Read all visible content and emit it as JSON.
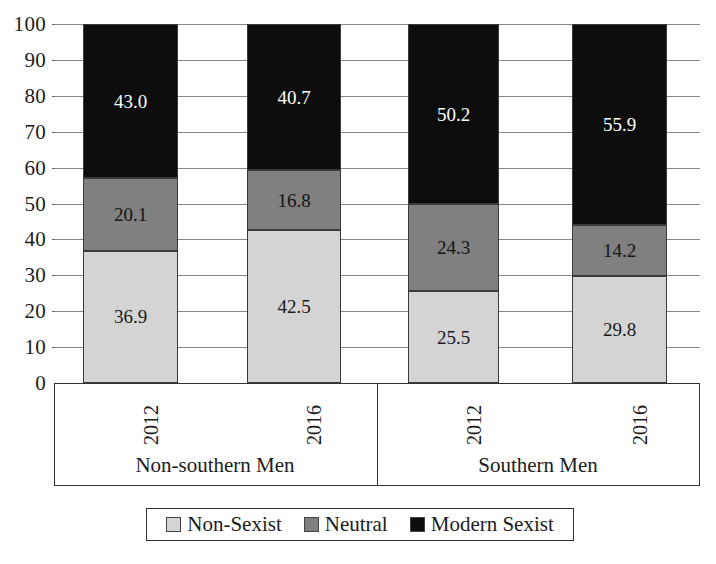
{
  "chart_data": {
    "type": "bar",
    "subtype": "stacked-bar-100",
    "title": "",
    "xlabel": "",
    "ylabel": "",
    "ylim": [
      0,
      100
    ],
    "ytick_step": 10,
    "grid": true,
    "legend_position": "bottom",
    "stacked": true,
    "categories": [
      "2012",
      "2016",
      "2012",
      "2016"
    ],
    "groups": [
      {
        "label": "Non-southern Men",
        "categories": [
          "2012",
          "2016"
        ]
      },
      {
        "label": "Southern Men",
        "categories": [
          "2012",
          "2016"
        ]
      }
    ],
    "series": [
      {
        "name": "Non-Sexist",
        "color": "#d4d4d4",
        "values": [
          36.9,
          42.5,
          25.5,
          29.8
        ]
      },
      {
        "name": "Neutral",
        "color": "#808080",
        "values": [
          20.1,
          16.8,
          24.3,
          14.2
        ]
      },
      {
        "name": "Modern Sexist",
        "color": "#0d0d0d",
        "values": [
          43.0,
          40.7,
          50.2,
          55.9
        ]
      }
    ],
    "ytick_labels": [
      "100",
      "90",
      "80",
      "70",
      "60",
      "50",
      "40",
      "30",
      "20",
      "10",
      "0"
    ]
  },
  "axis": {
    "ticks": [
      {
        "label": "100",
        "value": 100
      },
      {
        "label": "90",
        "value": 90
      },
      {
        "label": "80",
        "value": 80
      },
      {
        "label": "70",
        "value": 70
      },
      {
        "label": "60",
        "value": 60
      },
      {
        "label": "50",
        "value": 50
      },
      {
        "label": "40",
        "value": 40
      },
      {
        "label": "30",
        "value": 30
      },
      {
        "label": "20",
        "value": 20
      },
      {
        "label": "10",
        "value": 10
      },
      {
        "label": "0",
        "value": 0
      }
    ]
  },
  "bars": [
    {
      "year": "2012",
      "group": "Non-southern Men",
      "segments": [
        {
          "series": "Non-Sexist",
          "label": "36.9",
          "value": 36.9
        },
        {
          "series": "Neutral",
          "label": "20.1",
          "value": 20.1
        },
        {
          "series": "Modern Sexist",
          "label": "43.0",
          "value": 43.0
        }
      ]
    },
    {
      "year": "2016",
      "group": "Non-southern Men",
      "segments": [
        {
          "series": "Non-Sexist",
          "label": "42.5",
          "value": 42.5
        },
        {
          "series": "Neutral",
          "label": "16.8",
          "value": 16.8
        },
        {
          "series": "Modern Sexist",
          "label": "40.7",
          "value": 40.7
        }
      ]
    },
    {
      "year": "2012",
      "group": "Southern Men",
      "segments": [
        {
          "series": "Non-Sexist",
          "label": "25.5",
          "value": 25.5
        },
        {
          "series": "Neutral",
          "label": "24.3",
          "value": 24.3
        },
        {
          "series": "Modern Sexist",
          "label": "50.2",
          "value": 50.2
        }
      ]
    },
    {
      "year": "2016",
      "group": "Southern Men",
      "segments": [
        {
          "series": "Non-Sexist",
          "label": "29.8",
          "value": 29.8
        },
        {
          "series": "Neutral",
          "label": "14.2",
          "value": 14.2
        },
        {
          "series": "Modern Sexist",
          "label": "55.9",
          "value": 55.9
        }
      ]
    }
  ],
  "group_labels": [
    {
      "label": "Non-southern Men"
    },
    {
      "label": "Southern Men"
    }
  ],
  "legend": {
    "entries": [
      {
        "label": "Non-Sexist",
        "color": "#d4d4d4",
        "swatch": "swatch-light-gray"
      },
      {
        "label": "Neutral",
        "color": "#808080",
        "swatch": "swatch-mid-gray"
      },
      {
        "label": "Modern Sexist",
        "color": "#0d0d0d",
        "swatch": "swatch-black"
      }
    ]
  }
}
